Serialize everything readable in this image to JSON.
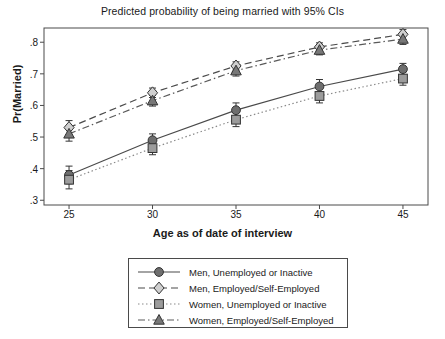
{
  "chart_data": {
    "type": "line",
    "title": "Predicted probability of being married with 95% CIs",
    "xlabel": "Age as of date of interview",
    "ylabel": "Pr(Married)",
    "x": [
      25,
      30,
      35,
      40,
      45
    ],
    "xticklabels": [
      "25",
      "30",
      "35",
      "40",
      "45"
    ],
    "yticklabels": [
      ".3",
      ".4",
      ".5",
      ".6",
      ".7",
      ".8"
    ],
    "yticks": [
      0.3,
      0.4,
      0.5,
      0.6,
      0.7,
      0.8
    ],
    "xlim": [
      23.5,
      46.5
    ],
    "ylim": [
      0.285,
      0.845
    ],
    "grid": false,
    "legend_position": "below-plot-center",
    "error_bars": "95% confidence intervals",
    "series": [
      {
        "name": "Men, Unemployed or Inactive",
        "marker": "circle",
        "linestyle": "solid",
        "color": "#4a4a4a",
        "marker_fill": "#6e6e6e",
        "values": [
          0.38,
          0.49,
          0.585,
          0.66,
          0.715
        ],
        "ci_low": [
          0.352,
          0.47,
          0.562,
          0.638,
          0.697
        ],
        "ci_high": [
          0.408,
          0.51,
          0.608,
          0.682,
          0.733
        ]
      },
      {
        "name": "Men, Employed/Self-Employed",
        "marker": "diamond",
        "linestyle": "dashed",
        "color": "#4a4a4a",
        "marker_fill": "#cfcfcf",
        "values": [
          0.53,
          0.64,
          0.725,
          0.785,
          0.825
        ],
        "ci_low": [
          0.508,
          0.625,
          0.712,
          0.772,
          0.808
        ],
        "ci_high": [
          0.552,
          0.655,
          0.738,
          0.798,
          0.84
        ]
      },
      {
        "name": "Women, Unemployed or Inactive",
        "marker": "square",
        "linestyle": "dotted",
        "color": "#8a8a8a",
        "marker_fill": "#9c9c9c",
        "values": [
          0.365,
          0.465,
          0.555,
          0.63,
          0.685
        ],
        "ci_low": [
          0.336,
          0.444,
          0.533,
          0.608,
          0.664
        ],
        "ci_high": [
          0.394,
          0.486,
          0.577,
          0.652,
          0.706
        ]
      },
      {
        "name": "Women, Employed/Self-Employed",
        "marker": "triangle",
        "linestyle": "dashdot",
        "color": "#5a5a5a",
        "marker_fill": "#787878",
        "values": [
          0.51,
          0.615,
          0.71,
          0.775,
          0.81
        ],
        "ci_low": [
          0.487,
          0.598,
          0.693,
          0.76,
          0.793
        ],
        "ci_high": [
          0.533,
          0.632,
          0.727,
          0.79,
          0.827
        ]
      }
    ]
  },
  "legend": {
    "items": [
      {
        "label": "Men, Unemployed or Inactive"
      },
      {
        "label": "Men, Employed/Self-Employed"
      },
      {
        "label": "Women, Unemployed or Inactive"
      },
      {
        "label": "Women, Employed/Self-Employed"
      }
    ]
  }
}
